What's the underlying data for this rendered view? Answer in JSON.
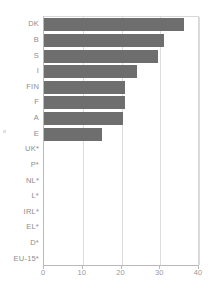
{
  "chart_data": {
    "type": "bar",
    "orientation": "horizontal",
    "title": "",
    "subtitle": "",
    "xlabel": "",
    "ylabel": "",
    "categories": [
      "DK",
      "B",
      "S",
      "I",
      "FIN",
      "F",
      "A",
      "E",
      "UK*",
      "P*",
      "NL*",
      "L*",
      "IRL*",
      "EL*",
      "D*",
      "EU-15*"
    ],
    "values": [
      36,
      31,
      29.5,
      24,
      21,
      21,
      20.5,
      15,
      0,
      0,
      0,
      0,
      0,
      0,
      0,
      0
    ],
    "xticks": [
      0,
      10,
      20,
      30,
      40
    ],
    "xlim": [
      0,
      40
    ],
    "grid": true,
    "grid_axis": "x",
    "legend": "none",
    "bar_color": "#6e6e6e",
    "axis_color": "#b9b9b9",
    "grid_color": "#dcdcdc",
    "label_color": "#8d8d8d"
  }
}
